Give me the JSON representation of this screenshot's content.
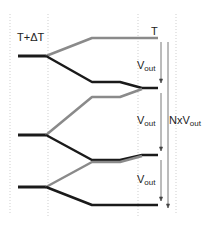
{
  "labels": {
    "left_temp": "T+ΔT",
    "right_temp": "T",
    "vout_main": "V",
    "vout_sub": "out",
    "total_prefix": "NxV",
    "total_sub": "out"
  },
  "colors": {
    "dark_line": "#1a1a1a",
    "gray_line": "#8a8a8a",
    "guide_line": "#c8c8c8",
    "arrow": "#555555"
  },
  "stages": [
    {
      "name": "stage-1",
      "vout_label": "V",
      "vout_sub": "out"
    },
    {
      "name": "stage-2",
      "vout_label": "V",
      "vout_sub": "out"
    },
    {
      "name": "stage-3",
      "vout_label": "V",
      "vout_sub": "out"
    }
  ]
}
